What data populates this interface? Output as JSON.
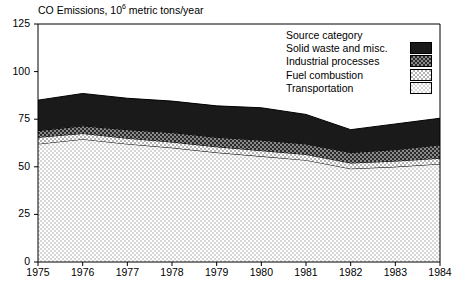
{
  "chart_data": {
    "type": "area",
    "title_main": "CO Emissions, 10",
    "title_sup": "6",
    "title_tail": " metric tons/year",
    "xlabel": "",
    "ylabel": "",
    "stacked": true,
    "grid": false,
    "ylim": [
      0,
      125
    ],
    "yticks": [
      0,
      25,
      50,
      75,
      100,
      125
    ],
    "ytick_labels": [
      "0",
      "25",
      "50",
      "75",
      "100",
      "125"
    ],
    "categories": [
      1975,
      1976,
      1977,
      1978,
      1979,
      1980,
      1981,
      1982,
      1983,
      1984
    ],
    "xtick_labels": [
      "1975",
      "1976",
      "1977",
      "1978",
      "1979",
      "1980",
      "1981",
      "1982",
      "1983",
      "1984"
    ],
    "series": [
      {
        "name": "Transportation",
        "fill": "stipple-lightest",
        "values": [
          62.0,
          64.5,
          62.0,
          60.0,
          57.5,
          55.5,
          53.5,
          49.0,
          50.0,
          51.5
        ]
      },
      {
        "name": "Fuel combustion",
        "fill": "stipple-light",
        "values": [
          3.5,
          3.0,
          3.0,
          3.0,
          3.0,
          3.0,
          3.0,
          3.0,
          3.0,
          3.0
        ]
      },
      {
        "name": "Industrial processes",
        "fill": "checker-dark",
        "values": [
          3.5,
          4.0,
          4.5,
          5.0,
          5.0,
          5.5,
          5.5,
          5.5,
          6.0,
          7.0
        ]
      },
      {
        "name": "Solid waste and misc.",
        "fill": "solid-black",
        "values": [
          16.0,
          17.0,
          16.5,
          16.5,
          16.5,
          17.0,
          15.5,
          12.0,
          13.5,
          14.0
        ]
      }
    ],
    "totals": [
      85.0,
      88.5,
      86.0,
      84.5,
      82.0,
      81.0,
      77.5,
      69.5,
      72.5,
      75.5
    ],
    "legend": {
      "position": "top-right",
      "header": "Source category",
      "entries": [
        {
          "label": "Solid waste and misc.",
          "fill": "solid-black"
        },
        {
          "label": "Industrial processes",
          "fill": "checker-dark"
        },
        {
          "label": "Fuel combustion",
          "fill": "stipple-light"
        },
        {
          "label": "Transportation",
          "fill": "stipple-lightest"
        }
      ]
    }
  }
}
